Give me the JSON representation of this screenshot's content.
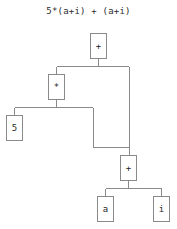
{
  "diagram": {
    "title": "5*(a+i) + (a+i)",
    "type": "expression-parse-tree",
    "background_color": "#ffffff",
    "line_color": "#8a8a8a",
    "text_color": "#1f1f1f",
    "nodes": [
      {
        "id": "plus_root",
        "label": "+",
        "x": 90,
        "y": 33,
        "w": 17,
        "h": 26
      },
      {
        "id": "times",
        "label": "*",
        "x": 48,
        "y": 74,
        "w": 17,
        "h": 26
      },
      {
        "id": "five",
        "label": "5",
        "x": 6,
        "y": 115,
        "w": 17,
        "h": 26
      },
      {
        "id": "plus_sub",
        "label": "+",
        "x": 120,
        "y": 155,
        "w": 17,
        "h": 26
      },
      {
        "id": "a",
        "label": "a",
        "x": 97,
        "y": 196,
        "w": 17,
        "h": 26
      },
      {
        "id": "i",
        "label": "i",
        "x": 153,
        "y": 196,
        "w": 17,
        "h": 26
      }
    ],
    "edges": [
      {
        "from": "plus_root",
        "to": "times"
      },
      {
        "from": "plus_root",
        "to": "plus_sub"
      },
      {
        "from": "times",
        "to": "five"
      },
      {
        "from": "times",
        "to": "plus_sub"
      },
      {
        "from": "plus_sub",
        "to": "a"
      },
      {
        "from": "plus_sub",
        "to": "i"
      }
    ]
  }
}
